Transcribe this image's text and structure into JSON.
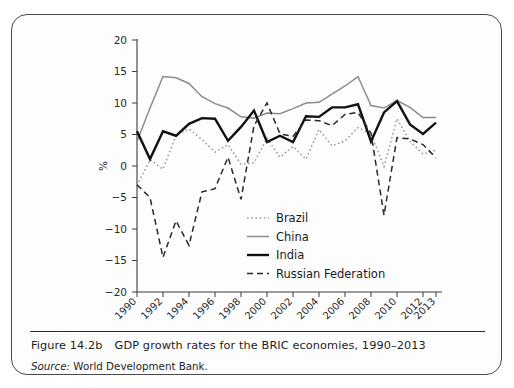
{
  "figure": {
    "caption_number": "Figure 14.2b",
    "caption_text": "GDP growth rates for the BRIC economies, 1990–2013",
    "source_label": "Source:",
    "source_text": "World Development Bank."
  },
  "chart_data": {
    "type": "line",
    "title": "",
    "subtitle": "",
    "xlabel": "",
    "ylabel": "%",
    "xlim": [
      1990,
      2013
    ],
    "ylim": [
      -20,
      20
    ],
    "ytick_labels": [
      "20",
      "15",
      "10",
      "5",
      "0",
      "−5",
      "−10",
      "−15",
      "−20"
    ],
    "ytick_values": [
      20,
      15,
      10,
      5,
      0,
      -5,
      -10,
      -15,
      -20
    ],
    "xtick_labels": [
      "1990",
      "1992",
      "1994",
      "1996",
      "1998",
      "2000",
      "2002",
      "2004",
      "2006",
      "2008",
      "2010",
      "2012",
      "2013"
    ],
    "xtick_values": [
      1990,
      1992,
      1994,
      1996,
      1998,
      2000,
      2002,
      2004,
      2006,
      2008,
      2010,
      2012,
      2013
    ],
    "x": [
      1990,
      1991,
      1992,
      1993,
      1994,
      1995,
      1996,
      1997,
      1998,
      1999,
      2000,
      2001,
      2002,
      2003,
      2004,
      2005,
      2006,
      2007,
      2008,
      2009,
      2010,
      2011,
      2012,
      2013
    ],
    "grid": false,
    "legend_position": "center",
    "series": [
      {
        "name": "Brazil",
        "color": "#9a9a9a",
        "style": "dotted",
        "width": 1.5,
        "values": [
          -3.1,
          1.0,
          -0.5,
          4.9,
          5.9,
          4.2,
          2.2,
          3.4,
          0.3,
          0.5,
          4.4,
          1.4,
          3.1,
          1.1,
          5.8,
          3.2,
          4.0,
          6.1,
          5.1,
          -0.1,
          7.5,
          3.9,
          1.9,
          2.5
        ]
      },
      {
        "name": "China",
        "color": "#8c8c8c",
        "style": "solid",
        "width": 1.5,
        "values": [
          3.9,
          9.2,
          14.2,
          14.0,
          13.1,
          11.0,
          9.9,
          9.2,
          7.8,
          7.6,
          8.4,
          8.3,
          9.1,
          10.0,
          10.1,
          11.4,
          12.7,
          14.2,
          9.6,
          9.2,
          10.4,
          9.3,
          7.7,
          7.7
        ]
      },
      {
        "name": "India",
        "color": "#111111",
        "style": "solid",
        "width": 2.4,
        "values": [
          5.5,
          1.1,
          5.5,
          4.8,
          6.7,
          7.6,
          7.5,
          4.0,
          6.2,
          8.8,
          3.8,
          4.8,
          3.8,
          7.9,
          7.8,
          9.3,
          9.3,
          9.8,
          3.9,
          8.5,
          10.3,
          6.6,
          5.1,
          6.9
        ]
      },
      {
        "name": "Russian Federation",
        "color": "#2a2a2a",
        "style": "dashed",
        "width": 1.5,
        "values": [
          -3.0,
          -5.0,
          -14.5,
          -8.7,
          -12.6,
          -4.1,
          -3.6,
          1.4,
          -5.3,
          6.4,
          10.0,
          5.1,
          4.7,
          7.3,
          7.2,
          6.4,
          8.2,
          8.5,
          5.2,
          -7.8,
          4.5,
          4.3,
          3.4,
          1.3
        ]
      }
    ],
    "legend": [
      {
        "label": "Brazil",
        "color": "#9a9a9a",
        "style": "dotted"
      },
      {
        "label": "China",
        "color": "#8c8c8c",
        "style": "solid"
      },
      {
        "label": "India",
        "color": "#111111",
        "style": "solid"
      },
      {
        "label": "Russian Federation",
        "color": "#2a2a2a",
        "style": "dashed"
      }
    ]
  }
}
